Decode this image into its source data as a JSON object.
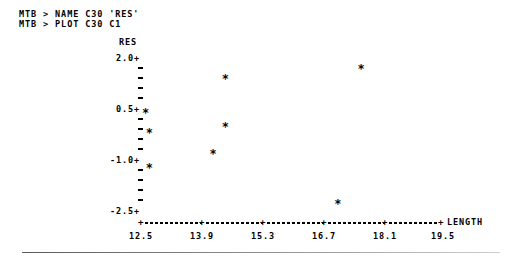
{
  "terminal": {
    "lines": [
      "MTB > NAME C30 'RES'",
      "MTB > PLOT C30 C1"
    ]
  },
  "chart_data": {
    "type": "scatter",
    "title": "",
    "ylabel": "RES",
    "xlabel": "LENGTH",
    "xlim": [
      12.5,
      19.5
    ],
    "ylim": [
      -2.5,
      2.0
    ],
    "xticks": [
      12.5,
      13.9,
      15.3,
      16.7,
      18.1,
      19.5
    ],
    "xtick_labels": [
      "12.5",
      "13.9",
      "15.3",
      "16.7",
      "18.1",
      "19.5"
    ],
    "yticks": [
      2.0,
      0.5,
      -1.0,
      -2.5
    ],
    "ytick_labels": [
      "2.0+",
      "0.5+",
      "-1.0+",
      "-2.5+"
    ],
    "minor_ticks_between": 4,
    "grid": false,
    "legend": null,
    "marker": "*",
    "points": [
      {
        "x": 12.59,
        "y": 0.5
      },
      {
        "x": 12.68,
        "y": -0.04
      },
      {
        "x": 12.68,
        "y": -1.0
      },
      {
        "x": 14.16,
        "y": -0.63
      },
      {
        "x": 14.44,
        "y": 0.13
      },
      {
        "x": 14.44,
        "y": 1.44
      },
      {
        "x": 17.05,
        "y": -1.99
      },
      {
        "x": 17.59,
        "y": 1.69
      }
    ]
  },
  "axis": {
    "y_title": "RES",
    "x_title": "LENGTH",
    "y_labels": [
      "2.0+",
      "0.5+",
      "-1.0+",
      "-2.5+"
    ],
    "x_labels": [
      "12.5",
      "13.9",
      "15.3",
      "16.7",
      "18.1",
      "19.5"
    ]
  }
}
